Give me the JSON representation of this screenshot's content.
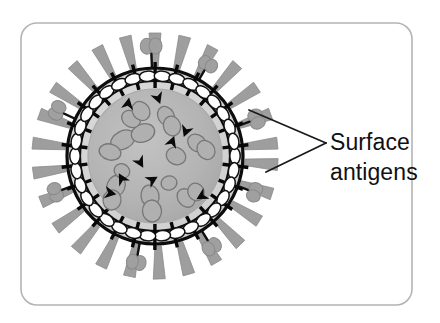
{
  "figure": {
    "canvas": {
      "width": 440,
      "height": 323,
      "background": "#ffffff"
    },
    "frame": {
      "name": "figure-border",
      "x": 21,
      "y": 23,
      "width": 391,
      "height": 282,
      "corner_radius": 16,
      "stroke": "#b4b4b4",
      "stroke_width": 1.6,
      "fill": "#ffffff"
    },
    "labels": [
      {
        "id": "surface-antigens-line1",
        "text": "Surface",
        "x": 330,
        "y": 150
      },
      {
        "id": "surface-antigens-line2",
        "text": "antigens",
        "x": 330,
        "y": 180
      }
    ],
    "leader": {
      "name": "leader-line-callout",
      "stroke": "#1a1a1a",
      "stroke_width": 1.8,
      "vertex": {
        "x": 326,
        "y": 143
      },
      "targets": [
        {
          "id": "leader-to-knob-antigen",
          "x": 249,
          "y": 110
        },
        {
          "id": "leader-to-spike-antigen",
          "x": 266,
          "y": 172
        }
      ]
    },
    "virus": {
      "center": {
        "x": 155,
        "y": 156
      },
      "envelope_radius": 88,
      "inner_ring_radius": 75,
      "core_radius": 67,
      "envelope_stroke": "#0d0d0d",
      "envelope_stroke_width": 3.2,
      "envelope_fill": "#d2d2d2",
      "core_fill": "#b3b3b3",
      "core_stroke": "#a8a8a8",
      "capsomere": {
        "count": 34,
        "fill": "#ffffff",
        "stroke": "#101010",
        "stroke_width": 1.5,
        "rx": 8.2,
        "ry": 5.2,
        "orbit_radius": 80
      },
      "pins": {
        "count": 26,
        "stroke": "#080808",
        "stroke_width": 3.4,
        "inner_radius": 68,
        "outer_radius": 94
      },
      "spikes": {
        "name": "surface-antigen-spike",
        "count": 26,
        "fill": "#9e9e9e",
        "stroke": "#8a8a8a",
        "stroke_width": 0.8,
        "base_radius": 90,
        "length": 33,
        "base_half_width": 3.2,
        "tip_half_width": 6.0,
        "angles_deg": [
          4,
          18,
          32,
          46,
          60,
          74,
          88,
          102,
          116,
          130,
          144,
          158,
          172,
          186,
          200,
          214,
          228,
          242,
          256,
          270,
          284,
          298,
          312,
          326,
          340,
          354
        ]
      },
      "knobs": {
        "name": "surface-antigen-knob",
        "fill": "#a0a0a0",
        "stroke": "#8a8a8a",
        "stalk_stroke": "#111111",
        "stalk_width": 2.4,
        "items": [
          {
            "angle_deg": 268,
            "stalk_len": 26,
            "lobe_rx": 8,
            "lobe_ry": 6.5,
            "spread": 8
          },
          {
            "angle_deg": 205,
            "stalk_len": 24,
            "lobe_rx": 7.5,
            "lobe_ry": 6,
            "spread": 7
          },
          {
            "angle_deg": 160,
            "stalk_len": 22,
            "lobe_rx": 7,
            "lobe_ry": 6,
            "spread": 7
          },
          {
            "angle_deg": 340,
            "stalk_len": 24,
            "lobe_rx": 7.5,
            "lobe_ry": 6,
            "spread": 7.5
          },
          {
            "angle_deg": 300,
            "stalk_len": 22,
            "lobe_rx": 7,
            "lobe_ry": 6,
            "spread": 7
          },
          {
            "angle_deg": 58,
            "stalk_len": 23,
            "lobe_rx": 7.5,
            "lobe_ry": 6,
            "spread": 7
          },
          {
            "angle_deg": 100,
            "stalk_len": 24,
            "lobe_rx": 7.5,
            "lobe_ry": 6,
            "spread": 7
          },
          {
            "angle_deg": 20,
            "stalk_len": 22,
            "lobe_rx": 7,
            "lobe_ry": 6,
            "spread": 7
          }
        ]
      },
      "nucleocapsid_blobs": {
        "name": "nucleocapsid-segment",
        "fill": "#b0b0b0",
        "stroke": "#767676",
        "stroke_width": 1.3,
        "items": [
          {
            "x": 123,
            "y": 140,
            "rx": 13,
            "ry": 9,
            "rot": -28
          },
          {
            "x": 143,
            "y": 133,
            "rx": 12,
            "ry": 9,
            "rot": -20
          },
          {
            "x": 110,
            "y": 152,
            "rx": 11,
            "ry": 8,
            "rot": 15
          },
          {
            "x": 131,
            "y": 119,
            "rx": 10,
            "ry": 8,
            "rot": 35
          },
          {
            "x": 141,
            "y": 111,
            "rx": 10,
            "ry": 8.5,
            "rot": 55
          },
          {
            "x": 166,
            "y": 116,
            "rx": 10,
            "ry": 8,
            "rot": 60
          },
          {
            "x": 172,
            "y": 126,
            "rx": 10,
            "ry": 8.5,
            "rot": 70
          },
          {
            "x": 176,
            "y": 156,
            "rx": 10,
            "ry": 8.5,
            "rot": 25
          },
          {
            "x": 197,
            "y": 143,
            "rx": 10,
            "ry": 8,
            "rot": 40
          },
          {
            "x": 206,
            "y": 150,
            "rx": 10,
            "ry": 8.5,
            "rot": 55
          },
          {
            "x": 116,
            "y": 186,
            "rx": 9,
            "ry": 11,
            "rot": 22
          },
          {
            "x": 112,
            "y": 200,
            "rx": 9,
            "ry": 10,
            "rot": 10
          },
          {
            "x": 150,
            "y": 196,
            "rx": 9,
            "ry": 11,
            "rot": -10
          },
          {
            "x": 152,
            "y": 211,
            "rx": 9.5,
            "ry": 11,
            "rot": -5
          },
          {
            "x": 186,
            "y": 198,
            "rx": 10,
            "ry": 8,
            "rot": 50
          },
          {
            "x": 196,
            "y": 192,
            "rx": 9,
            "ry": 8,
            "rot": 60
          },
          {
            "x": 122,
            "y": 171,
            "rx": 8,
            "ry": 7,
            "rot": 30
          },
          {
            "x": 169,
            "y": 183,
            "rx": 8,
            "ry": 7,
            "rot": -15
          }
        ]
      },
      "arrow_markers": {
        "name": "antigen-arrowhead",
        "fill": "#0a0a0a",
        "size": 6.5,
        "items": [
          {
            "x": 128,
            "y": 104,
            "rot": 10
          },
          {
            "x": 158,
            "y": 98,
            "rot": 160
          },
          {
            "x": 186,
            "y": 131,
            "rot": 200
          },
          {
            "x": 172,
            "y": 142,
            "rot": 20
          },
          {
            "x": 140,
            "y": 162,
            "rot": 150
          },
          {
            "x": 122,
            "y": 179,
            "rot": 330
          },
          {
            "x": 152,
            "y": 180,
            "rot": 60
          },
          {
            "x": 202,
            "y": 196,
            "rot": 240
          },
          {
            "x": 110,
            "y": 193,
            "rot": 100
          }
        ]
      }
    }
  }
}
